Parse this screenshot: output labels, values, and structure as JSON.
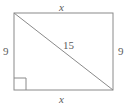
{
  "figure": {
    "kind": "geometry-diagram",
    "shape": "rectangle-with-diagonal",
    "stroke_color": "#8a8a8a",
    "text_color": "#5b5b5b",
    "background_color": "#ffffff",
    "rectangle": {
      "left": 14,
      "top": 13,
      "right": 113,
      "bottom": 90
    },
    "diagonal": {
      "x1": 14,
      "y1": 13,
      "x2": 113,
      "y2": 90
    },
    "right_angle_marker": {
      "corner": "bottom-left",
      "size": 12
    },
    "labels": {
      "top": "x",
      "bottom": "x",
      "left": "9",
      "right": "9",
      "diagonal": "15"
    }
  }
}
